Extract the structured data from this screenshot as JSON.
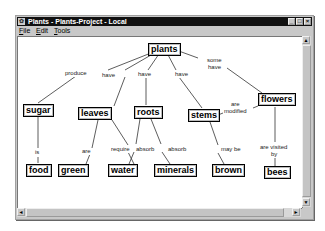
{
  "window": {
    "title": "Plants - Plants-Project - Local",
    "controls": {
      "minimize": "_",
      "maximize": "□",
      "close": "×"
    }
  },
  "menu": {
    "items": [
      {
        "label": "File",
        "accel": "F"
      },
      {
        "label": "Edit",
        "accel": "E"
      },
      {
        "label": "Tools",
        "accel": "T"
      }
    ]
  },
  "concept_map": {
    "nodes": {
      "plants": "plants",
      "sugar": "sugar",
      "leaves": "leaves",
      "roots": "roots",
      "stems": "stems",
      "flowers": "flowers",
      "food": "food",
      "green": "green",
      "water": "water",
      "minerals": "minerals",
      "brown": "brown",
      "bees": "bees"
    },
    "links": {
      "plants_sugar": "produce",
      "plants_leaves": "have",
      "plants_roots": "have",
      "plants_stems": "have",
      "plants_flowers_1": "some",
      "plants_flowers_2": "have",
      "sugar_food": "is",
      "leaves_green": "are",
      "leaves_water": "require",
      "roots_water": "absorb",
      "roots_minerals": "absorb",
      "stems_brown": "may be",
      "stems_flowers_1": "are",
      "stems_flowers_2": "modified",
      "flowers_bees_1": "are visited",
      "flowers_bees_2": "by"
    }
  },
  "scrollbars": {
    "up": "▲",
    "down": "▼",
    "left": "◄",
    "right": "►"
  }
}
